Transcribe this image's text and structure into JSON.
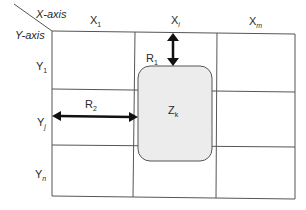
{
  "diagram": {
    "axis_labels": {
      "x_axis": "X-axis",
      "y_axis": "Y-axis"
    },
    "columns": [
      {
        "base": "X",
        "sub": "1",
        "sub_italic": false
      },
      {
        "base": "X",
        "sub": "i",
        "sub_italic": true
      },
      {
        "base": "X",
        "sub": "m",
        "sub_italic": true
      }
    ],
    "rows": [
      {
        "base": "Y",
        "sub": "1",
        "sub_italic": false
      },
      {
        "base": "Y",
        "sub": "j",
        "sub_italic": true
      },
      {
        "base": "Y",
        "sub": "n",
        "sub_italic": true
      }
    ],
    "zone": {
      "base": "Z",
      "sub": "k",
      "fill": "#ececec",
      "stroke": "#555555"
    },
    "distances": [
      {
        "base": "R",
        "sub": "1",
        "direction": "vertical"
      },
      {
        "base": "R",
        "sub": "2",
        "direction": "horizontal"
      }
    ],
    "colors": {
      "grid_line": "#555555",
      "arrow": "#111111",
      "zone_fill": "#ececec"
    }
  }
}
